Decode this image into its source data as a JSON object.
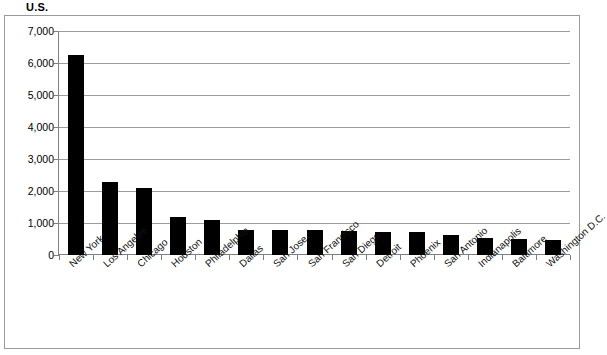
{
  "chart_data": {
    "type": "bar",
    "title": "U.S.",
    "xlabel": "",
    "ylabel": "",
    "ylim": [
      0,
      7000
    ],
    "ytick_values": [
      7000,
      6000,
      5000,
      4000,
      3000,
      2000,
      1000,
      0
    ],
    "ytick_labels": [
      "7,000",
      "6,000",
      "5,000",
      "4,000",
      "3,000",
      "2,000",
      "1,000",
      "0"
    ],
    "grid": true,
    "legend": false,
    "bar_color": "#000000",
    "gridline_color": "#9c9c9c",
    "axis_color": "#808080",
    "frame_color": "#9a9a9a",
    "categories": [
      "New York",
      "Los Angeles",
      "Chicago",
      "Houston",
      "Philadelphia",
      "Dallas",
      "San Jose",
      "San Francisco",
      "San Diego",
      "Detroit",
      "Phoenix",
      "San Antonio",
      "Indianapolis",
      "Baltimore",
      "Washington D.C."
    ],
    "values": [
      6250,
      2280,
      2090,
      1200,
      1080,
      790,
      780,
      770,
      760,
      730,
      720,
      630,
      540,
      490,
      470
    ]
  }
}
